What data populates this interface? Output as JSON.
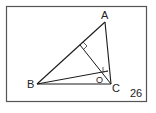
{
  "figure": {
    "number": "26",
    "vertices": {
      "A": {
        "label": "A",
        "x": 105,
        "y": 22
      },
      "B": {
        "label": "B",
        "x": 37,
        "y": 84
      },
      "C": {
        "label": "C",
        "x": 111,
        "y": 84
      }
    },
    "orthocenter": {
      "label": "O",
      "x": 101,
      "y": 78
    },
    "feet": {
      "from_C_on_AB": {
        "x": 80,
        "y": 45
      },
      "from_B_on_AC": {
        "x": 108,
        "y": 70
      }
    },
    "colors": {
      "line": "#1a1a1a",
      "frame": "#555555"
    }
  }
}
